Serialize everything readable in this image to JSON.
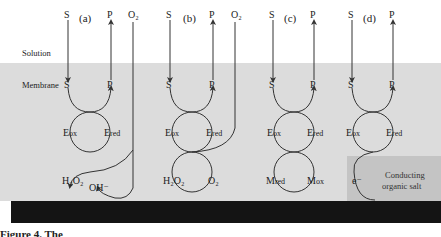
{
  "regions": {
    "solution_label": "Solution",
    "membrane_label": "Membrane",
    "conducting_salt_line1": "Conducting",
    "conducting_salt_line2": "organic salt"
  },
  "panels": [
    {
      "label": "(a)",
      "substrate": "S",
      "product": "P",
      "extra_top": "O₂",
      "enzyme_ox": "E",
      "enzyme_ox_sub": "ox",
      "enzyme_red": "E",
      "enzyme_red_sub": "red",
      "bottom_left": "H₂O₂",
      "bottom_right": "OH⁻"
    },
    {
      "label": "(b)",
      "substrate": "S",
      "product": "P",
      "extra_top": "O₂",
      "enzyme_ox": "E",
      "enzyme_ox_sub": "ox",
      "enzyme_red": "E",
      "enzyme_red_sub": "red",
      "bottom_left": "H₂O₂",
      "bottom_right": "O₂"
    },
    {
      "label": "(c)",
      "substrate": "S",
      "product": "P",
      "enzyme_ox": "E",
      "enzyme_ox_sub": "ox",
      "enzyme_red": "E",
      "enzyme_red_sub": "red",
      "bottom_left": "M",
      "bottom_left_sub": "red",
      "bottom_right": "M",
      "bottom_right_sub": "ox"
    },
    {
      "label": "(d)",
      "substrate": "S",
      "product": "P",
      "enzyme_ox": "E",
      "enzyme_ox_sub": "ox",
      "enzyme_red": "E",
      "enzyme_red_sub": "red",
      "bottom_left": "e⁻"
    }
  ],
  "caption": "Figure 4.  The",
  "colors": {
    "membrane": "#dcdcdc",
    "salt": "#c4c4c4",
    "electrode": "#141414",
    "line": "#333333"
  }
}
